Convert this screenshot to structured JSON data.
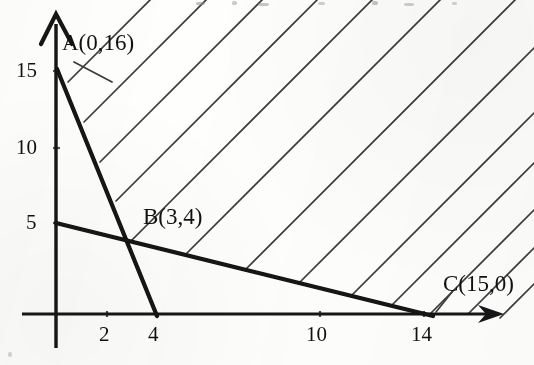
{
  "figure": {
    "kind": "hand-drawn scanned coordinate plot",
    "background_color": "#fefefd",
    "ink_color": "#141414",
    "hatch_color": "#3a3a3a"
  },
  "axes": {
    "x_axis": {
      "name": "x-axis",
      "arrow": true,
      "origin_px": 55,
      "line_y_px": 314,
      "arrow_tip_x_px": 502,
      "px_per_unit": 26.6,
      "tick_labels": [
        "2",
        "4",
        "10",
        "14"
      ],
      "tick_values": [
        2,
        4,
        10,
        14
      ],
      "tick_x_px": [
        107,
        156,
        320,
        424
      ]
    },
    "y_axis": {
      "name": "y-axis",
      "arrow": true,
      "line_x_px": 56,
      "arrow_tip_y_px": 14,
      "px_per_unit": 15.0,
      "tick_labels": [
        "5",
        "10",
        "15"
      ],
      "tick_values": [
        5,
        10,
        15
      ],
      "tick_y_px": [
        223,
        148,
        71
      ]
    }
  },
  "constraint_lines": [
    {
      "name": "steep-constraint-line",
      "from_label": "A",
      "to_label": "x-intercept-4",
      "from_px": [
        57,
        69
      ],
      "to_px": [
        157,
        315
      ],
      "stroke_width": 4.2
    },
    {
      "name": "shallow-constraint-line",
      "from_label": "y-intercept-5",
      "to_label": "C",
      "from_px": [
        56,
        223
      ],
      "to_px": [
        433,
        315
      ],
      "stroke_width": 4.2
    }
  ],
  "points": [
    {
      "name": "point-a",
      "label": "A(0,16)",
      "coords": [
        0,
        16
      ],
      "label_px": [
        62,
        33
      ],
      "marker_px": [
        57,
        69
      ]
    },
    {
      "name": "point-b",
      "label": "B(3,4)",
      "coords": [
        3,
        4
      ],
      "label_px": [
        143,
        206
      ],
      "marker_px": [
        128,
        241
      ]
    },
    {
      "name": "point-c",
      "label": "C(15,0)",
      "coords": [
        15,
        0
      ],
      "label_px": [
        443,
        273
      ],
      "marker_px": [
        434,
        314
      ]
    }
  ],
  "hatching": {
    "name": "feasible-region-hatching",
    "description": "parallel 45-degree lines sloping up to the right filling the feasible region above both constraint lines",
    "angle_deg": 45,
    "line_count": 13,
    "stroke_width": 1.7,
    "segments": [
      [
        68,
        82,
        196,
        -46
      ],
      [
        84,
        122,
        270,
        -64
      ],
      [
        100,
        162,
        330,
        -68
      ],
      [
        116,
        201,
        386,
        -69
      ],
      [
        132,
        240,
        440,
        -68
      ],
      [
        186,
        254,
        500,
        -60
      ],
      [
        246,
        269,
        534,
        -19
      ],
      [
        300,
        282,
        534,
        48
      ],
      [
        352,
        295,
        534,
        113
      ],
      [
        392,
        305,
        534,
        163
      ],
      [
        430,
        314,
        534,
        210
      ],
      [
        468,
        314,
        534,
        248
      ],
      [
        500,
        318,
        534,
        284
      ]
    ]
  },
  "reading": {
    "shaded_side": "above-right of both constraint lines",
    "vertices": [
      "A(0,16)",
      "B(3,4)",
      "C(15,0)"
    ]
  }
}
